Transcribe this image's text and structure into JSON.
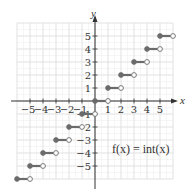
{
  "chart_data": {
    "type": "line",
    "title": "",
    "function_label": "f(x) = int(x)",
    "xlabel": "x",
    "ylabel": "y",
    "xlim": [
      -6,
      6
    ],
    "ylim": [
      -6,
      6
    ],
    "grid": true,
    "x_ticks": [
      -5,
      -4,
      -3,
      -2,
      -1,
      1,
      2,
      3,
      4,
      5
    ],
    "y_ticks": [
      -5,
      -4,
      -3,
      -2,
      -1,
      1,
      2,
      3,
      4,
      5
    ],
    "x_tick_labels": [
      "−5",
      "−4",
      "−3",
      "−2",
      "−1",
      "1",
      "2",
      "3",
      "4",
      "5"
    ],
    "y_tick_labels": [
      "−5",
      "−4",
      "−3",
      "−2",
      "−1",
      "1",
      "2",
      "3",
      "4",
      "5"
    ],
    "series": [
      {
        "name": "int(x)",
        "style": "step",
        "segments": [
          {
            "x_start": -6,
            "x_end": -5,
            "y": -6,
            "start": "closed",
            "end": "open"
          },
          {
            "x_start": -5,
            "x_end": -4,
            "y": -5,
            "start": "closed",
            "end": "open"
          },
          {
            "x_start": -4,
            "x_end": -3,
            "y": -4,
            "start": "closed",
            "end": "open"
          },
          {
            "x_start": -3,
            "x_end": -2,
            "y": -3,
            "start": "closed",
            "end": "open"
          },
          {
            "x_start": -2,
            "x_end": -1,
            "y": -2,
            "start": "closed",
            "end": "open"
          },
          {
            "x_start": -1,
            "x_end": 0,
            "y": -1,
            "start": "closed",
            "end": "open"
          },
          {
            "x_start": 0,
            "x_end": 1,
            "y": 0,
            "start": "closed",
            "end": "open"
          },
          {
            "x_start": 1,
            "x_end": 2,
            "y": 1,
            "start": "closed",
            "end": "open"
          },
          {
            "x_start": 2,
            "x_end": 3,
            "y": 2,
            "start": "closed",
            "end": "open"
          },
          {
            "x_start": 3,
            "x_end": 4,
            "y": 3,
            "start": "closed",
            "end": "open"
          },
          {
            "x_start": 4,
            "x_end": 5,
            "y": 4,
            "start": "closed",
            "end": "open"
          },
          {
            "x_start": 5,
            "x_end": 6,
            "y": 5,
            "start": "closed",
            "end": "open"
          }
        ]
      }
    ],
    "colors": {
      "step": "#6b6b6b",
      "axis": "#333333",
      "grid": "#dcdcdc"
    }
  }
}
